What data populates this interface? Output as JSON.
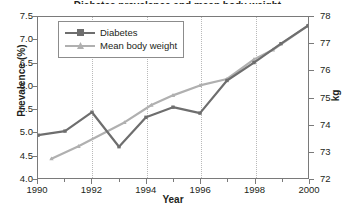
{
  "chart": {
    "title_clipped": "Diabetes prevalence and mean body weight",
    "x_title": "Year",
    "y_left_title": "Prevalence (%)",
    "y_right_title": "kg"
  },
  "legend": {
    "entries": [
      {
        "label": "Diabetes",
        "color": "#6e6e6e",
        "marker": "square"
      },
      {
        "label": "Mean body weight",
        "color": "#b0b0b0",
        "marker": "triangle"
      }
    ]
  },
  "axes": {
    "y_left_ticks": [
      "4.0",
      "4.5",
      "5.0",
      "5.5",
      "6.0",
      "6.5",
      "7.0",
      "7.5"
    ],
    "y_right_ticks": [
      "72",
      "73",
      "74",
      "75",
      "76",
      "77",
      "78"
    ],
    "x_ticks_major": [
      "1990",
      "1992",
      "1994",
      "1996",
      "1998",
      "2000"
    ],
    "x_ticks_minor": [
      "1991",
      "1993",
      "1995",
      "1997",
      "1999"
    ]
  },
  "chart_data": {
    "type": "line",
    "title": "Diabetes prevalence and mean body weight",
    "xlabel": "Year",
    "ylabel": "Prevalence (%)",
    "y2label": "kg",
    "xlim": [
      1990,
      2000
    ],
    "ylim": [
      4.0,
      7.5
    ],
    "y2lim": [
      72,
      78
    ],
    "grid": "vertical-dotted-at-even-years",
    "legend_position": "upper-left-inside",
    "x": [
      1990,
      1991,
      1992,
      1993,
      1994,
      1995,
      1996,
      1997,
      1998,
      1999,
      2000
    ],
    "series": [
      {
        "name": "Diabetes",
        "axis": "left",
        "unit": "%",
        "color": "#6e6e6e",
        "values": [
          4.93,
          5.02,
          5.43,
          4.68,
          5.32,
          5.54,
          5.41,
          6.12,
          6.51,
          6.92,
          7.31
        ]
      },
      {
        "name": "Mean body weight",
        "axis": "right",
        "unit": "kg",
        "color": "#b0b0b0",
        "x": [
          1990.5,
          1991.5,
          1993.2,
          1994.2,
          1995.0,
          1996.0,
          1997.0,
          1998.0,
          1998.7,
          2000.0
        ],
        "values": [
          72.72,
          73.18,
          74.07,
          74.72,
          75.08,
          75.45,
          75.69,
          76.42,
          76.78,
          77.68
        ]
      }
    ]
  }
}
